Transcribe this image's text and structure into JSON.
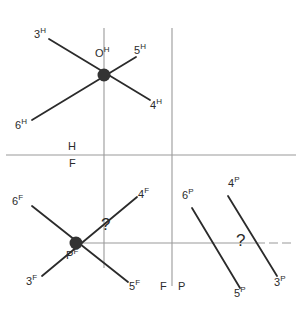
{
  "figure": {
    "width": 301,
    "height": 319,
    "background": "#ffffff",
    "line_color": "#2b2b2b",
    "axis_color": "#9a9a9a",
    "node_color": "#333333",
    "text_color": "#2b2b2b"
  },
  "axes": {
    "horizontal_divider": {
      "y": 155,
      "x1": 6,
      "x2": 296
    },
    "vertical_left": {
      "x": 104,
      "y1": 28,
      "y2": 268
    },
    "vertical_right": {
      "x": 172,
      "y1": 28,
      "y2": 286
    },
    "region_top_label": "H",
    "region_bottom_left_label": "F",
    "bottom_left_label": "F",
    "bottom_right_label": "P",
    "baseline": {
      "y": 243,
      "x1": 76,
      "x2": 290
    }
  },
  "clusters": {
    "h": {
      "node_label": "O",
      "node_superscript": "H",
      "node_x": 104,
      "node_y": 75,
      "endpoints": [
        {
          "label": "3",
          "sup": "H",
          "x": 40,
          "y": 36
        },
        {
          "label": "5",
          "sup": "H",
          "x": 140,
          "y": 52
        },
        {
          "label": "4",
          "sup": "H",
          "x": 155,
          "y": 105
        },
        {
          "label": "6",
          "sup": "H",
          "x": 22,
          "y": 125
        }
      ]
    },
    "f": {
      "node_label": "P",
      "node_superscript": "F",
      "node_x": 76,
      "node_y": 243,
      "endpoints": [
        {
          "label": "6",
          "sup": "F",
          "x": 18,
          "y": 203
        },
        {
          "label": "4",
          "sup": "F",
          "x": 142,
          "y": 193
        },
        {
          "label": "3",
          "sup": "F",
          "x": 30,
          "y": 283
        },
        {
          "label": "5",
          "sup": "F",
          "x": 133,
          "y": 287
        }
      ],
      "angle_marker": "?"
    },
    "p": {
      "endpoints": [
        {
          "label": "6",
          "sup": "P",
          "x": 187,
          "y": 196
        },
        {
          "label": "4",
          "sup": "P",
          "x": 232,
          "y": 185
        },
        {
          "label": "5",
          "sup": "P",
          "x": 240,
          "y": 295
        },
        {
          "label": "3",
          "sup": "P",
          "x": 280,
          "y": 284
        }
      ],
      "angle_marker": "?"
    }
  }
}
